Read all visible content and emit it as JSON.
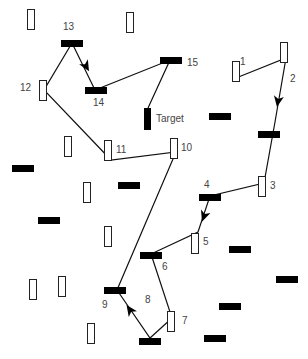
{
  "diagram": {
    "type": "path-through-distractors",
    "target_label": "Target",
    "labels": [
      {
        "text": "1",
        "x": 240,
        "y": 57
      },
      {
        "text": "2",
        "x": 290,
        "y": 74
      },
      {
        "text": "3",
        "x": 270,
        "y": 181
      },
      {
        "text": "4",
        "x": 204,
        "y": 180
      },
      {
        "text": "5",
        "x": 203,
        "y": 237
      },
      {
        "text": "6",
        "x": 162,
        "y": 262
      },
      {
        "text": "7",
        "x": 182,
        "y": 316
      },
      {
        "text": "8",
        "x": 145,
        "y": 295
      },
      {
        "text": "9",
        "x": 102,
        "y": 300
      },
      {
        "text": "10",
        "x": 181,
        "y": 143
      },
      {
        "text": "11",
        "x": 116,
        "y": 145
      },
      {
        "text": "12",
        "x": 20,
        "y": 83
      },
      {
        "text": "13",
        "x": 63,
        "y": 22
      },
      {
        "text": "14",
        "x": 93,
        "y": 98
      },
      {
        "text": "15",
        "x": 187,
        "y": 58
      }
    ],
    "white_rects": [
      {
        "x": 27,
        "y": 9
      },
      {
        "x": 126,
        "y": 12
      },
      {
        "x": 232,
        "y": 61
      },
      {
        "x": 280,
        "y": 42
      },
      {
        "x": 39,
        "y": 80
      },
      {
        "x": 64,
        "y": 136
      },
      {
        "x": 104,
        "y": 140
      },
      {
        "x": 170,
        "y": 138
      },
      {
        "x": 83,
        "y": 182
      },
      {
        "x": 258,
        "y": 176
      },
      {
        "x": 104,
        "y": 226
      },
      {
        "x": 191,
        "y": 233
      },
      {
        "x": 29,
        "y": 279
      },
      {
        "x": 58,
        "y": 276
      },
      {
        "x": 167,
        "y": 311
      },
      {
        "x": 87,
        "y": 323
      }
    ],
    "black_bars": [
      {
        "x": 61,
        "y": 40
      },
      {
        "x": 85,
        "y": 87
      },
      {
        "x": 160,
        "y": 57
      },
      {
        "x": 209,
        "y": 113
      },
      {
        "x": 258,
        "y": 131
      },
      {
        "x": 12,
        "y": 165
      },
      {
        "x": 118,
        "y": 182
      },
      {
        "x": 199,
        "y": 194
      },
      {
        "x": 38,
        "y": 217
      },
      {
        "x": 140,
        "y": 252
      },
      {
        "x": 229,
        "y": 246
      },
      {
        "x": 276,
        "y": 276
      },
      {
        "x": 219,
        "y": 303
      },
      {
        "x": 104,
        "y": 287
      },
      {
        "x": 139,
        "y": 338
      },
      {
        "x": 204,
        "y": 335
      }
    ],
    "target": {
      "x": 144,
      "y": 108
    },
    "path_points": [
      [
        236,
        78
      ],
      [
        286,
        58
      ],
      [
        275,
        122
      ],
      [
        264,
        183
      ],
      [
        210,
        196
      ],
      [
        198,
        232
      ],
      [
        151,
        254
      ],
      [
        172,
        318
      ],
      [
        150,
        338
      ],
      [
        117,
        290
      ],
      [
        176,
        152
      ],
      [
        111,
        160
      ],
      [
        44,
        90
      ],
      [
        72,
        43
      ],
      [
        95,
        90
      ],
      [
        170,
        60
      ],
      [
        148,
        108
      ]
    ],
    "arrows": [
      {
        "x": 278,
        "y": 101,
        "angle": 100
      },
      {
        "x": 204,
        "y": 216,
        "angle": 110
      },
      {
        "x": 130,
        "y": 310,
        "angle": -125
      },
      {
        "x": 86,
        "y": 66,
        "angle": 60
      }
    ],
    "colors": {
      "line": "#111111",
      "fill_dark": "#000000",
      "fill_light": "#ffffff",
      "label": "#444444"
    }
  }
}
